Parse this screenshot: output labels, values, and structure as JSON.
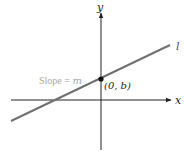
{
  "diagram": {
    "type": "slope-intercept-line",
    "axes": {
      "x_label": "x",
      "y_label": "y"
    },
    "line": {
      "label": "l",
      "color": "#707070"
    },
    "point": {
      "label": "(0, b)",
      "color": "#111111"
    },
    "annotation": {
      "slope_prefix": "Slope = ",
      "slope_var": "m",
      "color": "#a8a8a8"
    },
    "colors": {
      "axis": "#222222",
      "background": "#ffffff"
    }
  }
}
